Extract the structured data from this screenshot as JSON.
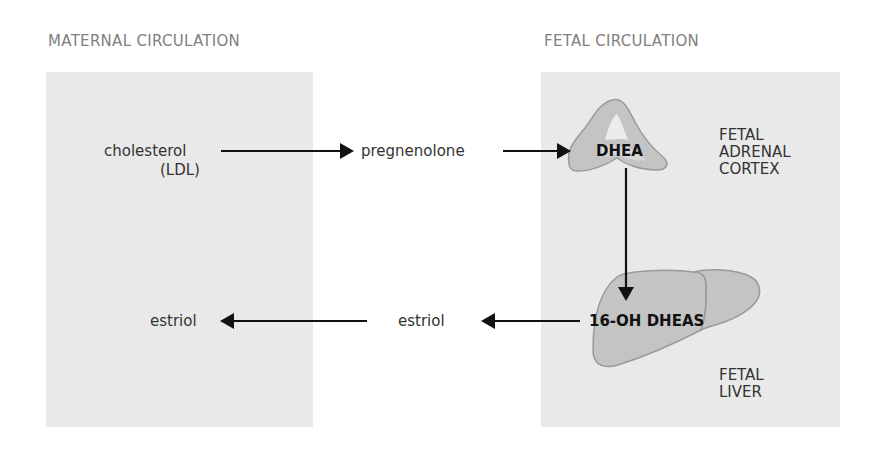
{
  "headings": {
    "maternal": "MATERNAL CIRCULATION",
    "fetal": "FETAL CIRCULATION"
  },
  "nodes": {
    "cholesterol": "cholesterol",
    "ldl": "(LDL)",
    "pregnenolone": "pregnenolone",
    "dhea": "DHEA",
    "oh_dheas": "16-OH DHEAS",
    "estriol_placenta": "estriol",
    "estriol_maternal": "estriol"
  },
  "organs": {
    "adrenal": "FETAL\nADRENAL\nCORTEX",
    "liver": "FETAL\nLIVER"
  },
  "colors": {
    "panel": "#e9e9e9",
    "organ_fill": "#c4c4c4",
    "organ_stroke": "#9a9a9a",
    "arrow": "#111111",
    "heading": "#808080"
  }
}
